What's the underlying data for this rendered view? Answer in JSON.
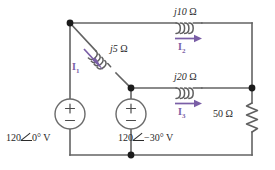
{
  "figure": {
    "name": "ac-circuit-schematic",
    "width": 275,
    "height": 170,
    "background": "#ffffff",
    "wire_color": "#636363",
    "current_color": "#7a5ea6"
  },
  "components": {
    "inductor_top": {
      "label_value": "j10",
      "label_unit": "Ω",
      "type": "inductor"
    },
    "inductor_diagonal": {
      "label_value": "j5",
      "label_unit": "Ω",
      "type": "inductor"
    },
    "inductor_middle": {
      "label_value": "j20",
      "label_unit": "Ω",
      "type": "inductor"
    },
    "resistor_right": {
      "label_value": "50",
      "label_unit": "Ω",
      "type": "resistor"
    },
    "source_left": {
      "magnitude": "120",
      "angle": "0°",
      "unit": "V",
      "polarity_top": "+",
      "polarity_bottom": "−",
      "type": "voltage-source"
    },
    "source_middle": {
      "magnitude": "120",
      "angle": "−30°",
      "unit": "V",
      "polarity_top": "+",
      "polarity_bottom": "−",
      "type": "voltage-source"
    }
  },
  "currents": {
    "i1": {
      "label": "I",
      "subscript": "1",
      "direction": "down-right"
    },
    "i2": {
      "label": "I",
      "subscript": "2",
      "direction": "right"
    },
    "i3": {
      "label": "I",
      "subscript": "3",
      "direction": "right"
    }
  }
}
